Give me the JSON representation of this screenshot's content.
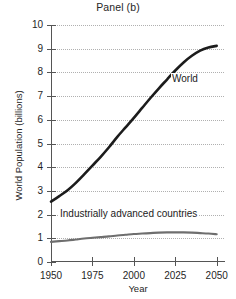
{
  "chart_data": {
    "type": "line",
    "title": "Panel (b)",
    "xlabel": "Year",
    "ylabel": "World Population (billions)",
    "xlim": [
      1950,
      2055
    ],
    "ylim": [
      0,
      10
    ],
    "grid": "horizontal-dotted",
    "legend": "inline-annotations",
    "x_ticks": [
      1950,
      1975,
      2000,
      2025,
      2050
    ],
    "x_tick_labels": [
      "1950",
      "1975",
      "2000",
      "2025",
      "2050"
    ],
    "y_ticks": [
      0,
      1,
      2,
      3,
      4,
      5,
      6,
      7,
      8,
      9,
      10
    ],
    "y_tick_labels": [
      "0",
      "1",
      "2",
      "3",
      "4",
      "5",
      "6",
      "7",
      "8",
      "9",
      "10"
    ],
    "x": [
      1950,
      1955,
      1960,
      1965,
      1970,
      1975,
      1980,
      1985,
      1990,
      1995,
      2000,
      2005,
      2010,
      2015,
      2020,
      2025,
      2030,
      2035,
      2040,
      2045,
      2050
    ],
    "series": [
      {
        "name": "World",
        "color": "#1c1c1c",
        "width": 2.6,
        "label_x": 2028,
        "label_y": 7.5,
        "values": [
          2.55,
          2.78,
          3.03,
          3.34,
          3.7,
          4.07,
          4.44,
          4.84,
          5.28,
          5.68,
          6.08,
          6.5,
          6.92,
          7.32,
          7.7,
          8.08,
          8.42,
          8.7,
          8.92,
          9.05,
          9.12
        ]
      },
      {
        "name": "Industrially advanced countries",
        "color": "#6e6e6e",
        "width": 2.1,
        "label_x": 1978,
        "label_y": 1.55,
        "values": [
          0.85,
          0.88,
          0.91,
          0.95,
          0.99,
          1.02,
          1.05,
          1.08,
          1.12,
          1.15,
          1.18,
          1.2,
          1.22,
          1.24,
          1.25,
          1.25,
          1.25,
          1.24,
          1.22,
          1.2,
          1.17
        ]
      }
    ],
    "annotations": [
      {
        "text": "World"
      },
      {
        "text": "Industrially advanced countries"
      }
    ]
  }
}
